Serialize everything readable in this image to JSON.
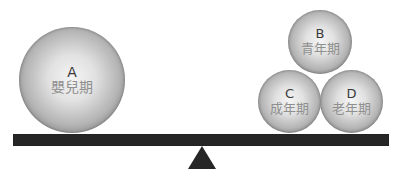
{
  "diagram": {
    "type": "balance-scale",
    "left_side": {
      "balls": [
        {
          "letter": "A",
          "term": "嬰兒期"
        }
      ]
    },
    "right_side": {
      "balls": [
        {
          "letter": "B",
          "term": "青年期"
        },
        {
          "letter": "C",
          "term": "成年期"
        },
        {
          "letter": "D",
          "term": "老年期"
        }
      ]
    },
    "colors": {
      "beam": "#262626",
      "fulcrum": "#262626",
      "letter_text": "#3a3a3a",
      "term_text": "#8f8f8f"
    }
  }
}
